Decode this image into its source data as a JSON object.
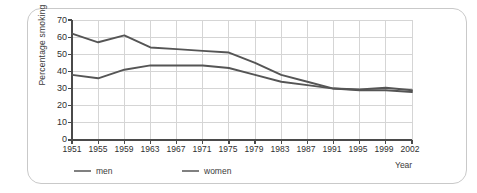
{
  "chart_data": {
    "type": "line",
    "title": "",
    "xlabel": "Year",
    "ylabel": "Percentage smoking",
    "xlim": [
      1951,
      2002
    ],
    "ylim": [
      0,
      70
    ],
    "ytick_step": 10,
    "grid": true,
    "legend_position": "bottom",
    "categories": [
      "1951",
      "1955",
      "1959",
      "1963",
      "1967",
      "1971",
      "1975",
      "1979",
      "1983",
      "1987",
      "1991",
      "1995",
      "1999",
      "2002"
    ],
    "x": [
      1951,
      1955,
      1959,
      1963,
      1967,
      1971,
      1975,
      1979,
      1983,
      1987,
      1991,
      1995,
      1999,
      2002
    ],
    "yticks": [
      "0",
      "10",
      "20",
      "30",
      "40",
      "50",
      "60",
      "70"
    ],
    "series": [
      {
        "name": "men",
        "color": "#555555",
        "values": [
          62,
          57,
          61,
          54,
          53,
          52,
          51,
          45,
          38,
          34,
          30,
          29,
          29,
          28
        ]
      },
      {
        "name": "women",
        "color": "#555555",
        "values": [
          38,
          36,
          41,
          43.5,
          43.5,
          43.5,
          42,
          38,
          34,
          32,
          30,
          29.5,
          30.5,
          29
        ]
      }
    ],
    "legend": [
      {
        "label": "men",
        "color": "#808080"
      },
      {
        "label": "women",
        "color": "#808080"
      }
    ],
    "grid_color": "#d5d5d5",
    "axis_color": "#4a4a4a",
    "frame_color": "#c9c9c9"
  }
}
